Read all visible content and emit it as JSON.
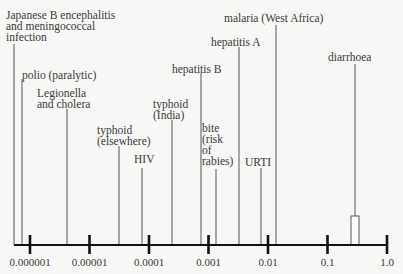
{
  "chart_data": {
    "type": "scatter",
    "title": "",
    "xlabel": "",
    "ylabel": "",
    "x_scale": "log",
    "xlim": [
      3e-07,
      1.0
    ],
    "grid": false,
    "legend": null,
    "tick_labels": [
      "0.000001",
      "0.00001",
      "0.0001",
      "0.001",
      "0.01",
      "0.1",
      "1.0"
    ],
    "tick_values": [
      1e-06,
      1e-05,
      0.0001,
      0.001,
      0.01,
      0.1,
      1.0
    ],
    "items": [
      {
        "label": "Japanese B encephalitis\nand meningococcal\ninfection",
        "value": 5e-07,
        "lx": 6,
        "ly": 10,
        "line_top": 44
      },
      {
        "label": "polio (paralytic)",
        "value": 7e-07,
        "lx": 22,
        "ly": 70,
        "line_top": 79
      },
      {
        "label": "Legionella\nand cholera",
        "value": 4e-06,
        "lx": 37,
        "ly": 88,
        "line_top": 109
      },
      {
        "label": "typhoid\n(elsewhere)",
        "value": 3e-05,
        "lx": 97,
        "ly": 125,
        "line_top": 146
      },
      {
        "label": "HIV",
        "value": 7e-05,
        "lx": 134,
        "ly": 154,
        "line_top": 168
      },
      {
        "label": "typhoid\n(India)",
        "value": 0.0002,
        "lx": 153,
        "ly": 99,
        "line_top": 120
      },
      {
        "label": "hepatitis B",
        "value": 0.0007,
        "lx": 172,
        "ly": 64,
        "line_top": 73
      },
      {
        "label": "bite\n(risk\nof\nrabies)",
        "value": 0.0012,
        "lx": 202,
        "ly": 123,
        "line_top": null
      },
      {
        "label": "hepatitis A",
        "value": 0.003,
        "lx": 211,
        "ly": 37,
        "line_top": 47
      },
      {
        "label": "URTI",
        "value": 0.007,
        "lx": 245,
        "ly": 157,
        "line_top": 168
      },
      {
        "label": "malaria (West Africa)",
        "value": 0.012,
        "lx": 224,
        "ly": 13,
        "line_top": 25
      },
      {
        "label": "diarrhoea",
        "value": 0.3,
        "lx": 328,
        "ly": 52,
        "line_top": 64,
        "box": true
      }
    ]
  }
}
